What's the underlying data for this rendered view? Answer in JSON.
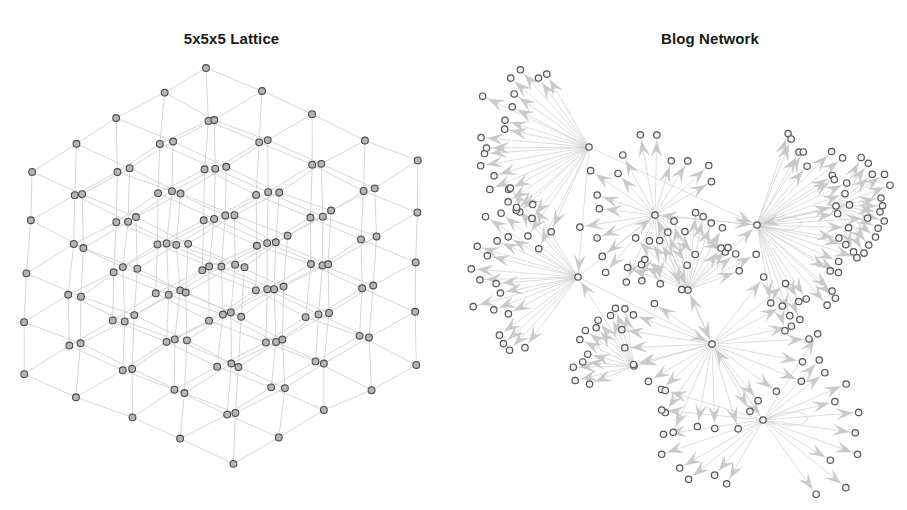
{
  "figure": {
    "width": 907,
    "height": 510,
    "background": "#ffffff"
  },
  "panels": [
    {
      "id": "lattice-panel",
      "title": "5x5x5 Lattice",
      "graph_type": "3d-lattice-projection",
      "description": "A 5 by 5 by 5 cubic lattice graph drawn in isometric-style 3D projection with undirected light grey edges and small grey circular nodes.",
      "node_count": 125,
      "edge_count": 300,
      "dimensions": [
        5,
        5,
        5
      ],
      "directed": false,
      "node_style": {
        "radius": 3.4,
        "fill": "#b5b5b5",
        "stroke": "#4a4a4a",
        "stroke_width": 1.1
      },
      "edge_style": {
        "stroke": "#cccccc",
        "stroke_width": 0.8,
        "arrows": false
      },
      "projection": {
        "origin_x": 208,
        "origin_y": 70,
        "axis_u": [
          -44.5,
          25.5
        ],
        "axis_v": [
          53.0,
          23.0
        ],
        "axis_w": [
          -1.5,
          50.0
        ],
        "jitter": 3.2,
        "jitter_seed": 1337
      }
    },
    {
      "id": "blog-panel",
      "title": "Blog Network",
      "graph_type": "directed-hub-network",
      "description": "A directed blog hyperlink network with several high-degree hub nodes, large pale grey arrowheads on every edge, and many peripheral leaf nodes arranged in radial fans.",
      "node_count": 196,
      "edge_count": 205,
      "directed": true,
      "node_style": {
        "radius": 3.2,
        "fill": "#f2f2f2",
        "stroke": "#555555",
        "stroke_width": 1.2
      },
      "edge_style": {
        "stroke": "#cfcfcf",
        "stroke_width": 0.7,
        "arrows": true,
        "arrow_fill": "#c8c8c8",
        "arrow_length": 17,
        "arrow_width": 12
      },
      "hubs": [
        {
          "id": "h1",
          "x": 589,
          "y": 147,
          "leaf_count": 26,
          "fan_start_deg": 112,
          "fan_end_deg": 255,
          "radius_min": 56,
          "radius_max": 118,
          "label": "top-left-hub"
        },
        {
          "id": "h2",
          "x": 757,
          "y": 225,
          "leaf_count": 30,
          "fan_start_deg": -72,
          "fan_end_deg": 82,
          "radius_min": 48,
          "radius_max": 112,
          "label": "right-hub"
        },
        {
          "id": "h3",
          "x": 578,
          "y": 277,
          "leaf_count": 20,
          "fan_start_deg": 128,
          "fan_end_deg": 238,
          "radius_min": 50,
          "radius_max": 112,
          "label": "left-hub"
        },
        {
          "id": "h4",
          "x": 655,
          "y": 215,
          "leaf_count": 22,
          "fan_start_deg": 28,
          "fan_end_deg": 330,
          "radius_min": 34,
          "radius_max": 82,
          "label": "core-hub-a"
        },
        {
          "id": "h5",
          "x": 688,
          "y": 290,
          "leaf_count": 18,
          "fan_start_deg": 200,
          "fan_end_deg": 340,
          "radius_min": 32,
          "radius_max": 78,
          "label": "core-hub-b"
        },
        {
          "id": "h6",
          "x": 712,
          "y": 344,
          "leaf_count": 22,
          "fan_start_deg": -52,
          "fan_end_deg": 214,
          "radius_min": 40,
          "radius_max": 98,
          "label": "lower-hub"
        },
        {
          "id": "h7",
          "x": 763,
          "y": 420,
          "leaf_count": 24,
          "fan_start_deg": -58,
          "fan_end_deg": 196,
          "radius_min": 44,
          "radius_max": 108,
          "label": "bottom-hub"
        },
        {
          "id": "h8",
          "x": 836,
          "y": 206,
          "leaf_count": 14,
          "fan_start_deg": -62,
          "fan_end_deg": 68,
          "radius_min": 32,
          "radius_max": 58,
          "label": "far-right-hub"
        },
        {
          "id": "h9",
          "x": 634,
          "y": 366,
          "leaf_count": 12,
          "fan_start_deg": 158,
          "fan_end_deg": 262,
          "radius_min": 30,
          "radius_max": 62,
          "label": "lower-left-hub"
        }
      ],
      "hub_links": [
        [
          "h1",
          "h2"
        ],
        [
          "h1",
          "h3"
        ],
        [
          "h2",
          "h4"
        ],
        [
          "h2",
          "h8"
        ],
        [
          "h3",
          "h4"
        ],
        [
          "h3",
          "h6"
        ],
        [
          "h4",
          "h5"
        ],
        [
          "h4",
          "h2"
        ],
        [
          "h5",
          "h6"
        ],
        [
          "h5",
          "h2"
        ],
        [
          "h6",
          "h7"
        ],
        [
          "h6",
          "h9"
        ],
        [
          "h4",
          "h6"
        ],
        [
          "h7",
          "h6"
        ],
        [
          "h9",
          "h3"
        ],
        [
          "h8",
          "h2"
        ],
        [
          "h5",
          "h4"
        ],
        [
          "h6",
          "h5"
        ]
      ],
      "self_loops": [
        "h7",
        "h2"
      ],
      "layout_seed": 20240
    }
  ]
}
